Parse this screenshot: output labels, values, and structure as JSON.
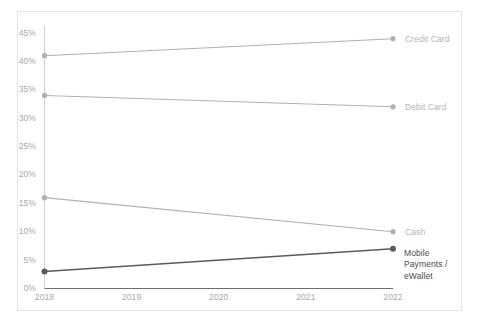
{
  "chart_data": {
    "type": "line",
    "title": "",
    "subtitle": "",
    "xlabel": "",
    "ylabel": "",
    "x": [
      "2018",
      "2019",
      "2020",
      "2021",
      "2022"
    ],
    "xlim": [
      "2018",
      "2022"
    ],
    "ylim": [
      0,
      45
    ],
    "ytick_labels": [
      "45%",
      "40%",
      "35%",
      "30%",
      "25%",
      "20%",
      "15%",
      "10%",
      "5%",
      "0%"
    ],
    "ytick_values": [
      45,
      40,
      35,
      30,
      25,
      20,
      15,
      10,
      5,
      0
    ],
    "grid": false,
    "legend": "inline-right-labels",
    "series": [
      {
        "name": "Credit Card",
        "label": "Credit Card",
        "color": "#b0b0b0",
        "x": [
          "2018",
          "2022"
        ],
        "values": [
          41,
          44
        ]
      },
      {
        "name": "Debit Card",
        "label": "Debit Card",
        "color": "#b0b0b0",
        "x": [
          "2018",
          "2022"
        ],
        "values": [
          34,
          32
        ]
      },
      {
        "name": "Cash",
        "label": "Cash",
        "color": "#b0b0b0",
        "x": [
          "2018",
          "2022"
        ],
        "values": [
          16,
          10
        ]
      },
      {
        "name": "Mobile Payments / eWallet",
        "label": "Mobile\nPayments /\neWallet",
        "color": "#5a5a5a",
        "x": [
          "2018",
          "2022"
        ],
        "values": [
          3,
          7
        ]
      }
    ],
    "axis_color": "#c9c9c9",
    "x_axis_color": "#6e6e6e",
    "card_border_color": "#e4e4e4",
    "background": "#ffffff"
  },
  "y_ticks": [
    {
      "label": "45%",
      "value": 45
    },
    {
      "label": "40%",
      "value": 40
    },
    {
      "label": "35%",
      "value": 35
    },
    {
      "label": "30%",
      "value": 30
    },
    {
      "label": "25%",
      "value": 25
    },
    {
      "label": "20%",
      "value": 20
    },
    {
      "label": "15%",
      "value": 15
    },
    {
      "label": "10%",
      "value": 10
    },
    {
      "label": "5%",
      "value": 5
    },
    {
      "label": "0%",
      "value": 0
    }
  ],
  "x_ticks": [
    {
      "label": "2018"
    },
    {
      "label": "2019"
    },
    {
      "label": "2020"
    },
    {
      "label": "2021"
    },
    {
      "label": "2022"
    }
  ],
  "series_labels": [
    {
      "text": "Credit Card"
    },
    {
      "text": "Debit Card"
    },
    {
      "text": "Cash"
    },
    {
      "text": "Mobile\nPayments /\neWallet"
    }
  ]
}
